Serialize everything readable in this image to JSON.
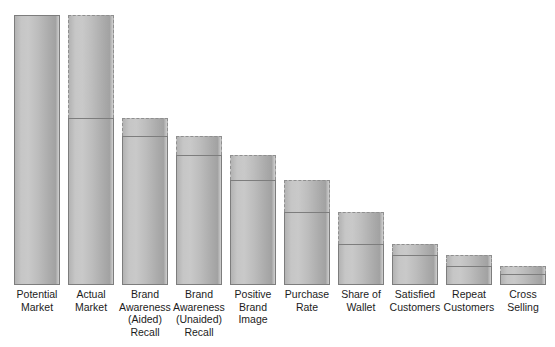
{
  "chart_data": {
    "type": "bar",
    "title": "",
    "subtitle": "",
    "xlabel": "",
    "ylabel": "",
    "grid": false,
    "legend": null,
    "axis_visible": false,
    "note": "Marketing funnel / leaky bucket chart. Each stage bar shows a dashed outline for the full potential of the previous stage and a solid-outlined lower portion for the realized value of that stage.",
    "value_unit": "relative scale (0-100)",
    "ylim": [
      0,
      100
    ],
    "categories": [
      "Potential\nMarket",
      "Actual\nMarket",
      "Brand\nAwareness\n(Aided)\nRecall",
      "Brand\nAwareness\n(Unaided)\nRecall",
      "Positive\nBrand\nImage",
      "Purchase\nRate",
      "Share of\nWallet",
      "Satisfied\nCustomers",
      "Repeat\nCustomers",
      "Cross\nSelling"
    ],
    "series": [
      {
        "name": "Potential (dashed outline, full height)",
        "values": [
          100,
          100,
          62,
          55,
          48,
          39,
          27,
          15,
          11,
          7
        ]
      },
      {
        "name": "Actual (solid outline, lower portion)",
        "values": [
          100,
          62,
          55,
          48,
          39,
          27,
          15,
          11,
          7,
          4
        ]
      }
    ],
    "bars": [
      {
        "label": "Potential\nMarket",
        "potential": 100,
        "actual": 100,
        "dashed_top": false
      },
      {
        "label": "Actual\nMarket",
        "potential": 100,
        "actual": 62,
        "dashed_top": true
      },
      {
        "label": "Brand\nAwareness\n(Aided)\nRecall",
        "potential": 62,
        "actual": 55,
        "dashed_top": true
      },
      {
        "label": "Brand\nAwareness\n(Unaided)\nRecall",
        "potential": 55,
        "actual": 48,
        "dashed_top": true
      },
      {
        "label": "Positive\nBrand\nImage",
        "potential": 48,
        "actual": 39,
        "dashed_top": true
      },
      {
        "label": "Purchase\nRate",
        "potential": 39,
        "actual": 27,
        "dashed_top": true
      },
      {
        "label": "Share of\nWallet",
        "potential": 27,
        "actual": 15,
        "dashed_top": true
      },
      {
        "label": "Satisfied\nCustomers",
        "potential": 15,
        "actual": 11,
        "dashed_top": true
      },
      {
        "label": "Repeat\nCustomers",
        "potential": 11,
        "actual": 7,
        "dashed_top": true
      },
      {
        "label": "Cross\nSelling",
        "potential": 7,
        "actual": 4,
        "dashed_top": true
      }
    ],
    "colors": {
      "bar_fill_light": "#c9c9c9",
      "bar_fill_mid": "#bdbdbd",
      "bar_fill_dark": "#a2a2a2",
      "solid_border": "#7d7d7d",
      "dashed_border": "#8f8f8f",
      "label_text": "#1c1c1c",
      "background": "#ffffff"
    },
    "labels": [
      "Potential\nMarket",
      "Actual\nMarket",
      "Brand\nAwareness\n(Aided)\nRecall",
      "Brand\nAwareness\n(Unaided)\nRecall",
      "Positive\nBrand\nImage",
      "Purchase\nRate",
      "Share of\nWallet",
      "Satisfied\nCustomers",
      "Repeat\nCustomers",
      "Cross\nSelling"
    ]
  }
}
